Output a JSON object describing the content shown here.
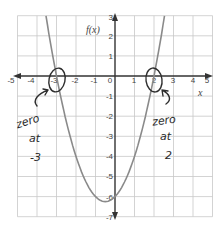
{
  "chart_data": {
    "type": "line",
    "title": "",
    "function": "f(x) = (x + 3)(x - 2) = x^2 + x - 6",
    "xlabel": "x",
    "ylabel": "f(x)",
    "xlim": [
      -5,
      5
    ],
    "ylim": [
      -7,
      3
    ],
    "grid": true,
    "x_ticks": [
      "-5",
      "-4",
      "-3",
      "-2",
      "-1",
      "0",
      "1",
      "2",
      "3",
      "4",
      "5"
    ],
    "y_ticks": [
      "3",
      "2",
      "1",
      "-1",
      "-2",
      "-3",
      "-4",
      "-5",
      "-6",
      "-7"
    ],
    "series": [
      {
        "name": "f(x)",
        "x": [
          -3.54,
          -3,
          -2,
          -1,
          -0.5,
          0,
          1,
          2,
          2.54
        ],
        "y": [
          3,
          0,
          -4,
          -6,
          -6.25,
          -6,
          -4,
          0,
          3
        ]
      }
    ],
    "vertex": [
      -0.5,
      -6.25
    ],
    "zeros": [
      -3,
      2
    ],
    "annotations": [
      {
        "text_lines": [
          "zero",
          "at",
          "-3"
        ],
        "target": [
          -3,
          0
        ]
      },
      {
        "text_lines": [
          "zero",
          "at",
          "2"
        ],
        "target": [
          2,
          0
        ]
      }
    ]
  },
  "labels": {
    "x_axis_title": "x",
    "y_axis_title": "f(x)",
    "x_ticks": [
      "-5",
      "-4",
      "-3",
      "-2",
      "-1",
      "0",
      "1",
      "2",
      "3",
      "4",
      "5"
    ],
    "y_ticks": [
      "3",
      "2",
      "1",
      "-1",
      "-2",
      "-3",
      "-4",
      "-5",
      "-6",
      "-7"
    ]
  },
  "annotations": {
    "left": {
      "line1": "zero",
      "line2": "at",
      "line3": "-3"
    },
    "right": {
      "line1": "zero",
      "line2": "at",
      "line3": "2"
    }
  },
  "colors": {
    "grid": "#c8c8c8",
    "axis": "#333333",
    "curve": "#8a8a8a",
    "ink": "#2e2e2e"
  }
}
